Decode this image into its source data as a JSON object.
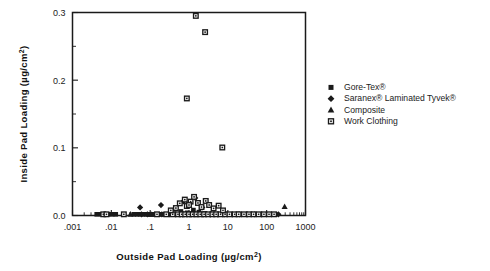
{
  "chart_data": {
    "type": "scatter",
    "title": "",
    "xlabel": "Outside Pad Loading (µg/cm²)",
    "ylabel": "Inside Pad Loading (µg/cm²)",
    "xscale": "log",
    "yscale": "linear",
    "xlim": [
      0.001,
      1000
    ],
    "ylim": [
      0.0,
      0.3
    ],
    "grid": false,
    "xticks": [
      0.001,
      0.01,
      0.1,
      1,
      10,
      100,
      1000
    ],
    "xtick_labels": [
      ".001",
      ".01",
      ".1",
      "1",
      "10",
      "100",
      "1000"
    ],
    "yticks": [
      0.0,
      0.1,
      0.2,
      0.3
    ],
    "ytick_labels": [
      "0.0",
      "0.1",
      "0.2",
      "0.3"
    ],
    "yticks_minor": [
      0.05,
      0.15,
      0.25
    ],
    "legend_position": "right",
    "series": [
      {
        "name": "Gore-Tex®",
        "marker": "filled-square",
        "color": "#1a1a1a",
        "points": [
          [
            0.0042,
            0.0
          ],
          [
            0.0055,
            0.0
          ],
          [
            0.0068,
            0.0
          ],
          [
            0.0082,
            0.0
          ],
          [
            0.0105,
            0.0
          ],
          [
            0.013,
            0.0
          ],
          [
            0.038,
            0.0
          ],
          [
            0.046,
            0.0
          ],
          [
            0.055,
            0.0
          ],
          [
            0.066,
            0.0
          ],
          [
            0.078,
            0.0
          ],
          [
            0.092,
            0.0
          ],
          [
            0.105,
            0.0
          ],
          [
            0.12,
            0.0
          ],
          [
            0.135,
            0.0
          ],
          [
            0.155,
            0.0
          ],
          [
            0.18,
            0.0
          ],
          [
            0.205,
            0.0
          ],
          [
            0.235,
            0.0
          ],
          [
            0.265,
            0.0
          ],
          [
            0.3,
            0.0
          ],
          [
            0.34,
            0.0
          ],
          [
            0.42,
            0.0
          ],
          [
            0.48,
            0.0
          ],
          [
            0.55,
            0.0
          ],
          [
            0.62,
            0.0
          ],
          [
            0.72,
            0.0
          ],
          [
            0.85,
            0.0
          ],
          [
            0.95,
            0.0
          ],
          [
            1.15,
            0.0
          ],
          [
            1.35,
            0.0
          ],
          [
            1.6,
            0.0
          ],
          [
            1.9,
            0.0
          ],
          [
            2.3,
            0.0
          ],
          [
            2.8,
            0.0
          ],
          [
            3.4,
            0.0
          ],
          [
            4.2,
            0.0
          ],
          [
            5.5,
            0.0
          ],
          [
            7.0,
            0.0
          ],
          [
            9.0,
            0.0
          ],
          [
            12.0,
            0.0
          ],
          [
            16.0,
            0.0
          ],
          [
            21.0,
            0.0
          ],
          [
            28.0,
            0.0
          ],
          [
            38.0,
            0.0
          ],
          [
            52.0,
            0.0
          ],
          [
            70.0,
            0.0
          ],
          [
            95.0,
            0.0
          ],
          [
            125.0,
            0.0
          ],
          [
            165.0,
            0.0
          ],
          [
            0.62,
            0.006
          ],
          [
            0.9,
            0.004
          ],
          [
            1.3,
            0.008
          ],
          [
            1.8,
            0.005
          ],
          [
            2.6,
            0.003
          ]
        ]
      },
      {
        "name": "Saranex® Laminated Tyvek®",
        "marker": "filled-diamond",
        "color": "#1a1a1a",
        "points": [
          [
            0.06,
            0.0
          ],
          [
            0.085,
            0.0
          ],
          [
            0.2,
            0.0
          ],
          [
            0.31,
            0.0
          ],
          [
            0.46,
            0.0
          ],
          [
            0.68,
            0.0
          ],
          [
            1.05,
            0.0
          ],
          [
            1.6,
            0.0
          ],
          [
            2.4,
            0.0
          ],
          [
            3.6,
            0.0
          ],
          [
            5.4,
            0.0
          ],
          [
            8.2,
            0.0
          ],
          [
            13.0,
            0.0
          ],
          [
            20.0,
            0.0
          ],
          [
            32.0,
            0.0
          ],
          [
            48.0,
            0.0
          ],
          [
            75.0,
            0.0
          ],
          [
            200.0,
            0.0
          ],
          [
            0.055,
            0.012
          ],
          [
            0.72,
            0.021
          ],
          [
            1.45,
            0.026
          ],
          [
            0.19,
            0.0155
          ],
          [
            2.2,
            0.012
          ]
        ]
      },
      {
        "name": "Composite",
        "marker": "filled-triangle",
        "color": "#1a1a1a",
        "points": [
          [
            0.031,
            0.0
          ],
          [
            0.105,
            0.0
          ],
          [
            0.42,
            0.0
          ],
          [
            0.95,
            0.0
          ],
          [
            1.9,
            0.0
          ],
          [
            3.8,
            0.0
          ],
          [
            8.5,
            0.0
          ],
          [
            19.0,
            0.0
          ],
          [
            42.0,
            0.0
          ],
          [
            0.35,
            0.004
          ],
          [
            1.25,
            0.007
          ],
          [
            290.0,
            0.013
          ]
        ]
      },
      {
        "name": "Work Clothing",
        "marker": "open-square-dot",
        "color": "#1a1a1a",
        "points": [
          [
            0.0062,
            0.0
          ],
          [
            0.0075,
            0.0
          ],
          [
            0.021,
            0.0
          ],
          [
            0.15,
            0.0
          ],
          [
            0.26,
            0.0
          ],
          [
            0.38,
            0.0
          ],
          [
            0.52,
            0.0
          ],
          [
            0.65,
            0.0
          ],
          [
            0.8,
            0.0
          ],
          [
            1.0,
            0.0
          ],
          [
            1.25,
            0.0
          ],
          [
            1.55,
            0.0
          ],
          [
            1.95,
            0.0
          ],
          [
            2.45,
            0.0
          ],
          [
            3.1,
            0.0
          ],
          [
            4.0,
            0.0
          ],
          [
            5.0,
            0.0
          ],
          [
            6.5,
            0.0
          ],
          [
            8.5,
            0.0
          ],
          [
            11.0,
            0.0
          ],
          [
            15.0,
            0.0
          ],
          [
            19.0,
            0.0
          ],
          [
            26.0,
            0.0
          ],
          [
            35.0,
            0.0
          ],
          [
            46.0,
            0.0
          ],
          [
            62.0,
            0.0
          ],
          [
            85.0,
            0.0
          ],
          [
            115.0,
            0.0
          ],
          [
            155.0,
            0.0
          ],
          [
            0.46,
            0.011
          ],
          [
            0.58,
            0.018
          ],
          [
            0.78,
            0.0235
          ],
          [
            0.88,
            0.014
          ],
          [
            1.1,
            0.0205
          ],
          [
            1.35,
            0.0275
          ],
          [
            1.7,
            0.0185
          ],
          [
            2.1,
            0.0125
          ],
          [
            2.7,
            0.0215
          ],
          [
            3.3,
            0.0155
          ],
          [
            4.3,
            0.0105
          ],
          [
            5.8,
            0.0145
          ],
          [
            7.5,
            0.0075
          ],
          [
            0.34,
            0.0075
          ],
          [
            1.0,
            0.0155
          ],
          [
            0.88,
            0.173
          ],
          [
            1.5,
            0.295
          ],
          [
            2.6,
            0.271
          ],
          [
            7.2,
            0.1005
          ]
        ]
      }
    ]
  },
  "legend": {
    "entries": [
      {
        "label": "Gore-Tex®",
        "marker": "filled-square"
      },
      {
        "label": "Saranex® Laminated Tyvek®",
        "marker": "filled-diamond"
      },
      {
        "label": "Composite",
        "marker": "filled-triangle"
      },
      {
        "label": "Work Clothing",
        "marker": "open-square-dot"
      }
    ]
  }
}
